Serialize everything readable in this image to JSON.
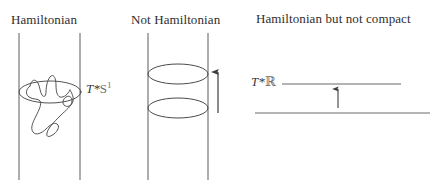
{
  "figure": {
    "width": 444,
    "height": 194,
    "background": "#ffffff",
    "stroke_color": "#5a5a5a",
    "text_color": "#2e2e2e"
  },
  "panels": [
    {
      "id": "panel-hamiltonian",
      "title": "Hamiltonian",
      "label_prefix": "T*",
      "label_base": "S",
      "label_exponent": "1",
      "label_full": "T*S1",
      "shape": "cylinder-with-knotted-curve",
      "has_arrow": false
    },
    {
      "id": "panel-not-hamiltonian",
      "title": "Not Hamiltonian",
      "label_prefix": "",
      "label_base": "",
      "label_exponent": "",
      "label_full": "",
      "shape": "cylinder-with-two-circles",
      "has_arrow": true,
      "arrow_direction": "up"
    },
    {
      "id": "panel-hamiltonian-not-compact",
      "title": "Hamiltonian but not compact",
      "label_prefix": "T*",
      "label_base": "ℝ",
      "label_exponent": "",
      "label_full": "T*ℝ",
      "shape": "two-horizontal-lines",
      "has_arrow": true,
      "arrow_direction": "up"
    }
  ]
}
